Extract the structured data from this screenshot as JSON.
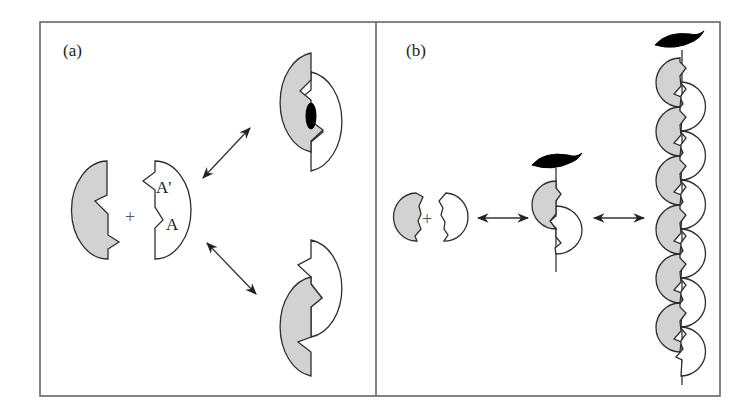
{
  "figure": {
    "panels": [
      {
        "id": "a",
        "label": "(a)",
        "description": "Two complementary subunits with binding sites A and A' associate into either a closed dimer (binding a ligand) or an open, staggered dimer.",
        "subunits": {
          "grey_subunit": "grey half-disc with zigzag edge",
          "white_subunit": "white half-disc with zigzag edge"
        },
        "site_labels": [
          "A'",
          "A"
        ],
        "operator": "+",
        "arrows": [
          "bidirectional-up-right",
          "bidirectional-down-right"
        ],
        "products": [
          "closed dimer with bound ligand",
          "open staggered dimer"
        ]
      },
      {
        "id": "b",
        "label": "(b)",
        "description": "Subunits polymerize along a stalk capped by a ligand into a long helical filament.",
        "operator": "+",
        "arrows": [
          "bidirectional-horizontal",
          "bidirectional-horizontal"
        ],
        "stages": [
          "free subunits",
          "capped dimer on stalk",
          "long filament"
        ],
        "filament_grey_units": 6,
        "filament_white_units": 6
      }
    ],
    "colors": {
      "grey_fill": "#d2d2d2",
      "outline": "#2e2e2e",
      "ligand": "#000000",
      "frame": "#666666"
    }
  }
}
